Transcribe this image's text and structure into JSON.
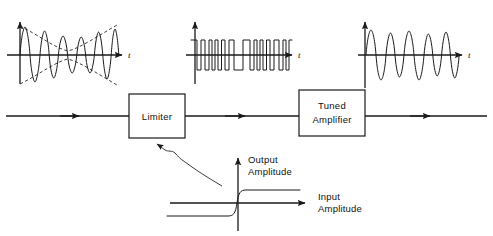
{
  "figure": {
    "kind": "block-diagram"
  },
  "blocks": [
    {
      "id": "limiter",
      "label": "Limiter",
      "lines": [
        "Limiter"
      ]
    },
    {
      "id": "tuned-amplifier",
      "label": "Tuned Amplifier",
      "lines": [
        "Tuned",
        "Amplifier"
      ]
    }
  ],
  "waveforms": [
    {
      "id": "input-fm-with-am",
      "name": "amplitude-varying-fm-waveform",
      "time_axis_label": "t",
      "envelope": "bowtie",
      "amplitude_constant": false
    },
    {
      "id": "limited-square-wave",
      "name": "clipped-square-wave",
      "time_axis_label": "t",
      "envelope": "flat",
      "amplitude_constant": true
    },
    {
      "id": "output-fm-sine",
      "name": "constant-amplitude-fm-sine",
      "time_axis_label": "t",
      "envelope": "flat",
      "amplitude_constant": true
    }
  ],
  "transfer_curve": {
    "id": "limiter-transfer-characteristic",
    "y_axis_label_lines": [
      "Output",
      "Amplitude"
    ],
    "x_axis_label_lines": [
      "Input",
      "Amplitude"
    ],
    "shape": "hard-limiting-step"
  },
  "annotations": {
    "leader_arrow": "curved-leader-to-limiter"
  },
  "colors": {
    "ink": "#1a1a1a",
    "envelope": "#2a2a2a",
    "background": "#ffffff"
  }
}
